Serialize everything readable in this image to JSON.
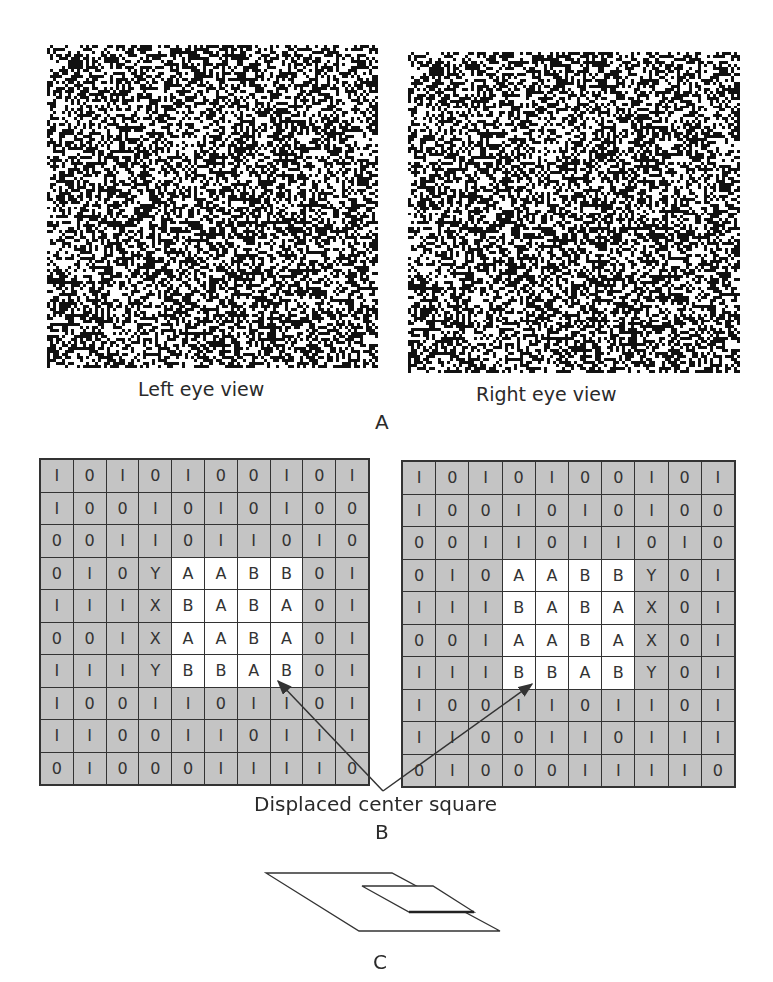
{
  "panel_a": {
    "letter": "A",
    "left_label": "Left eye view",
    "right_label": "Right eye view"
  },
  "panel_b": {
    "letter": "B",
    "annotation": "Displaced center square",
    "left_grid": [
      [
        "1",
        "0",
        "1",
        "0",
        "1",
        "0",
        "0",
        "1",
        "0",
        "1"
      ],
      [
        "1",
        "0",
        "0",
        "1",
        "0",
        "1",
        "0",
        "1",
        "0",
        "0"
      ],
      [
        "0",
        "0",
        "1",
        "1",
        "0",
        "1",
        "1",
        "0",
        "1",
        "0"
      ],
      [
        "0",
        "1",
        "0",
        "Y",
        "A",
        "A",
        "B",
        "B",
        "0",
        "1"
      ],
      [
        "1",
        "1",
        "1",
        "X",
        "B",
        "A",
        "B",
        "A",
        "0",
        "1"
      ],
      [
        "0",
        "0",
        "1",
        "X",
        "A",
        "A",
        "B",
        "A",
        "0",
        "1"
      ],
      [
        "1",
        "1",
        "1",
        "Y",
        "B",
        "B",
        "A",
        "B",
        "0",
        "1"
      ],
      [
        "1",
        "0",
        "0",
        "1",
        "1",
        "0",
        "1",
        "1",
        "0",
        "1"
      ],
      [
        "1",
        "1",
        "0",
        "0",
        "1",
        "1",
        "0",
        "1",
        "1",
        "1"
      ],
      [
        "0",
        "1",
        "0",
        "0",
        "0",
        "1",
        "1",
        "1",
        "1",
        "0"
      ]
    ],
    "left_white_region": {
      "rows": [
        3,
        6
      ],
      "cols": [
        4,
        7
      ]
    },
    "right_grid": [
      [
        "1",
        "0",
        "1",
        "0",
        "1",
        "0",
        "0",
        "1",
        "0",
        "1"
      ],
      [
        "1",
        "0",
        "0",
        "1",
        "0",
        "1",
        "0",
        "1",
        "0",
        "0"
      ],
      [
        "0",
        "0",
        "1",
        "1",
        "0",
        "1",
        "1",
        "0",
        "1",
        "0"
      ],
      [
        "0",
        "1",
        "0",
        "A",
        "A",
        "B",
        "B",
        "Y",
        "0",
        "1"
      ],
      [
        "1",
        "1",
        "1",
        "B",
        "A",
        "B",
        "A",
        "X",
        "0",
        "1"
      ],
      [
        "0",
        "0",
        "1",
        "A",
        "A",
        "B",
        "A",
        "X",
        "0",
        "1"
      ],
      [
        "1",
        "1",
        "1",
        "B",
        "B",
        "A",
        "B",
        "Y",
        "0",
        "1"
      ],
      [
        "1",
        "0",
        "0",
        "1",
        "1",
        "0",
        "1",
        "1",
        "0",
        "1"
      ],
      [
        "1",
        "1",
        "0",
        "0",
        "1",
        "1",
        "0",
        "1",
        "1",
        "1"
      ],
      [
        "0",
        "1",
        "0",
        "0",
        "0",
        "1",
        "1",
        "1",
        "1",
        "0"
      ]
    ],
    "right_white_region": {
      "rows": [
        3,
        6
      ],
      "cols": [
        3,
        6
      ]
    }
  },
  "panel_c": {
    "letter": "C"
  },
  "colors": {
    "grid_gray": "#c4c4c4",
    "grid_line": "#333333",
    "ink": "#222222"
  }
}
